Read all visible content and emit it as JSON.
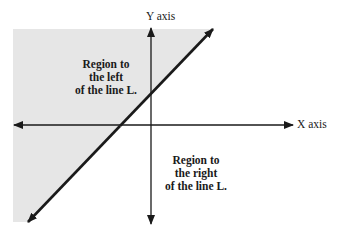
{
  "diagram": {
    "type": "coordinate-plane-half-plane",
    "colors": {
      "background": "#ffffff",
      "shaded_region": "#e6e6e6",
      "lines": "#1a1a1a",
      "text": "#1a1a1a"
    },
    "axes": {
      "x_label": "X axis",
      "y_label": "Y axis"
    },
    "line": {
      "name": "L"
    },
    "regions": {
      "left": {
        "lines": [
          "Region to",
          "the left",
          "of the line L."
        ],
        "shaded": true
      },
      "right": {
        "lines": [
          "Region to",
          "the right",
          "of the line L."
        ],
        "shaded": false
      }
    }
  }
}
